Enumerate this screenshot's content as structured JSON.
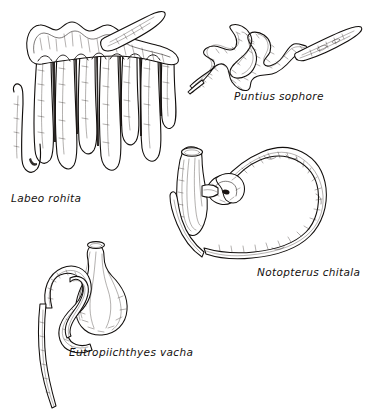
{
  "plate": {
    "title": "Alimentary canals of four freshwater fish species",
    "background_color": "#ffffff",
    "ink_color": "#120f0d",
    "width": 369,
    "height": 414,
    "style": "pen-and-ink scientific line drawing"
  },
  "figures": [
    {
      "id": "labeo",
      "caption": "Labeo rohita",
      "subject": "alimentary-canal",
      "description": "Long coiled intestine arranged in many parallel hairpin loops suspended from a curved transverse band; a short separate looped tube lies at the left",
      "loop_count": 7,
      "position": {
        "left": 4,
        "top": 8,
        "width": 180,
        "height": 186
      },
      "caption_position": {
        "left": 11,
        "top": 192
      }
    },
    {
      "id": "puntius",
      "caption": "Puntius sophore",
      "subject": "alimentary-canal",
      "description": "Slender intestine thrown into a few open zig-zag coils ending in a tapered spindle-shaped swim bladder at upper right",
      "loop_count": 3,
      "position": {
        "left": 186,
        "top": 22,
        "width": 178,
        "height": 74
      },
      "caption_position": {
        "left": 234,
        "top": 90
      }
    },
    {
      "id": "notopterus",
      "caption": "Notopterus chitala",
      "subject": "alimentary-canal",
      "description": "Large sac-like stomach at left joined by a short knotted pylorus to a thick U-shaped intestine sweeping right and down",
      "loop_count": 1,
      "position": {
        "left": 168,
        "top": 138,
        "width": 198,
        "height": 132
      },
      "caption_position": {
        "left": 257,
        "top": 266
      }
    },
    {
      "id": "eutropiichthyes",
      "caption": "Eutropiichthyes vacha",
      "subject": "alimentary-canal",
      "description": "Pear-shaped stomach with a short cardiac tube above, encircled by a doubled-back intestine whose slender limb trails far down the page",
      "loop_count": 2,
      "position": {
        "left": 26,
        "top": 232,
        "width": 142,
        "height": 180
      },
      "caption_position": {
        "left": 69,
        "top": 346
      }
    }
  ]
}
